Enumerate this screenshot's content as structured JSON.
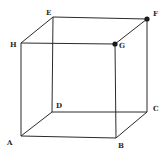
{
  "diagram": {
    "type": "cube",
    "vertices": [
      {
        "name": "A",
        "x": 21,
        "y": 136,
        "label_x": 7,
        "label_y": 145,
        "filled": false
      },
      {
        "name": "B",
        "x": 116,
        "y": 138,
        "label_x": 118,
        "label_y": 148,
        "filled": false
      },
      {
        "name": "C",
        "x": 147,
        "y": 112,
        "label_x": 153,
        "label_y": 111,
        "filled": false
      },
      {
        "name": "D",
        "x": 52,
        "y": 112,
        "label_x": 56,
        "label_y": 108,
        "filled": false
      },
      {
        "name": "E",
        "x": 53,
        "y": 17,
        "label_x": 46,
        "label_y": 15,
        "filled": false
      },
      {
        "name": "F",
        "x": 147,
        "y": 19,
        "label_x": 153,
        "label_y": 16,
        "filled": true
      },
      {
        "name": "G",
        "x": 115,
        "y": 44,
        "label_x": 119,
        "label_y": 48,
        "filled": true
      },
      {
        "name": "H",
        "x": 21,
        "y": 43,
        "label_x": 10,
        "label_y": 47,
        "filled": false
      }
    ],
    "edges": [
      [
        "A",
        "B"
      ],
      [
        "B",
        "C"
      ],
      [
        "C",
        "D"
      ],
      [
        "D",
        "A"
      ],
      [
        "H",
        "G"
      ],
      [
        "G",
        "F"
      ],
      [
        "F",
        "E"
      ],
      [
        "E",
        "H"
      ],
      [
        "A",
        "H"
      ],
      [
        "B",
        "G"
      ],
      [
        "C",
        "F"
      ],
      [
        "D",
        "E"
      ]
    ],
    "line_color": "#2a2a2a",
    "dot_color": "#1a1a1a"
  }
}
